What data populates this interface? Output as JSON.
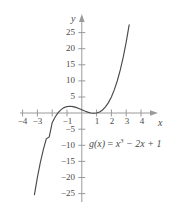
{
  "figure": {
    "equation_label": {
      "func": "g(x)",
      "equals": "=",
      "term1_base": "x",
      "term1_exp": "3",
      "term2": "− 2x",
      "term3": "+ 1",
      "full_text": "g(x) = x3 − 2x + 1"
    },
    "axis_names": {
      "x": "x",
      "y": "y"
    },
    "colors": {
      "curve": "#4a4a4a",
      "axis": "#9a9a9a",
      "text": "#4a4a4a",
      "background": "#ffffff"
    }
  },
  "chart_data": {
    "type": "line",
    "title": "",
    "subtitle": "",
    "xlabel": "x",
    "ylabel": "y",
    "annotations": [
      "g(x) = x3 − 2x + 1"
    ],
    "legend": [],
    "legend_position": "none",
    "grid": false,
    "xlim": [
      -4.2,
      4.6
    ],
    "ylim": [
      -27,
      27
    ],
    "xticks": [
      -4,
      -3,
      -2,
      -1,
      1,
      2,
      3,
      4
    ],
    "xtick_labels": [
      "−4",
      "−3",
      "",
      "−1",
      "1",
      "2",
      "3",
      "4"
    ],
    "yticks": [
      -25,
      -20,
      -15,
      -10,
      -5,
      5,
      10,
      15,
      20,
      25
    ],
    "ytick_labels": [
      "−25",
      "−20",
      "−15",
      "−10",
      "−5",
      "5",
      "10",
      "15",
      "20",
      "25"
    ],
    "series": [
      {
        "name": "g(x) = x^3 - 2x + 1",
        "formula": "x**3 - 2*x + 1",
        "x_range": [
          -3.2,
          3.2
        ],
        "x": [
          -3.2,
          -3.0,
          -2.8,
          -2.6,
          -2.4,
          -2.2,
          -2.0,
          -1.8,
          -1.6,
          -1.4,
          -1.2,
          -1.0,
          -0.8,
          -0.6,
          -0.4,
          -0.2,
          0.0,
          0.2,
          0.4,
          0.6,
          0.8,
          1.0,
          1.2,
          1.4,
          1.6,
          1.8,
          2.0,
          2.2,
          2.4,
          2.6,
          2.8,
          3.0,
          3.2
        ],
        "y": [
          -25.37,
          -20.0,
          -15.35,
          -11.38,
          -8.02,
          -7.44,
          -3.0,
          -1.23,
          0.11,
          1.06,
          1.67,
          2.0,
          2.09,
          1.98,
          1.74,
          1.39,
          1.0,
          0.61,
          0.26,
          -0.0,
          -0.09,
          0.0,
          0.33,
          0.94,
          1.9,
          3.23,
          5.0,
          7.25,
          10.02,
          13.38,
          17.35,
          22.0,
          27.37
        ]
      }
    ]
  }
}
